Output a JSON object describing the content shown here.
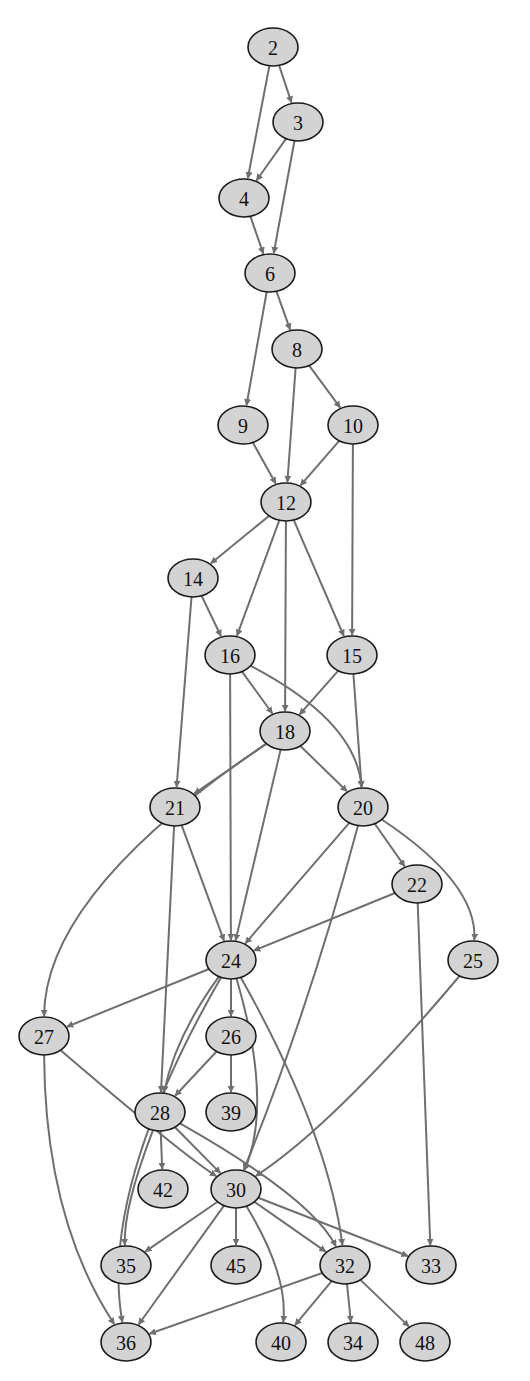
{
  "graph": {
    "type": "directed-acyclic-graph",
    "colors": {
      "node_fill": "#d3d3d3",
      "node_stroke": "#1a1a1a",
      "edge": "#6f6f6f",
      "background": "#ffffff"
    },
    "nodes": [
      {
        "id": "2",
        "label": "2",
        "x": 273,
        "y": 47
      },
      {
        "id": "3",
        "label": "3",
        "x": 298,
        "y": 122
      },
      {
        "id": "4",
        "label": "4",
        "x": 244,
        "y": 198
      },
      {
        "id": "6",
        "label": "6",
        "x": 270,
        "y": 273
      },
      {
        "id": "8",
        "label": "8",
        "x": 297,
        "y": 349
      },
      {
        "id": "9",
        "label": "9",
        "x": 243,
        "y": 425
      },
      {
        "id": "10",
        "label": "10",
        "x": 353,
        "y": 425
      },
      {
        "id": "12",
        "label": "12",
        "x": 286,
        "y": 502
      },
      {
        "id": "14",
        "label": "14",
        "x": 193,
        "y": 578
      },
      {
        "id": "16",
        "label": "16",
        "x": 230,
        "y": 655
      },
      {
        "id": "15",
        "label": "15",
        "x": 352,
        "y": 655
      },
      {
        "id": "18",
        "label": "18",
        "x": 285,
        "y": 731
      },
      {
        "id": "21",
        "label": "21",
        "x": 175,
        "y": 807
      },
      {
        "id": "20",
        "label": "20",
        "x": 363,
        "y": 807
      },
      {
        "id": "22",
        "label": "22",
        "x": 417,
        "y": 884
      },
      {
        "id": "24",
        "label": "24",
        "x": 231,
        "y": 960
      },
      {
        "id": "25",
        "label": "25",
        "x": 473,
        "y": 960
      },
      {
        "id": "27",
        "label": "27",
        "x": 44,
        "y": 1036
      },
      {
        "id": "26",
        "label": "26",
        "x": 231,
        "y": 1036
      },
      {
        "id": "28",
        "label": "28",
        "x": 160,
        "y": 1112
      },
      {
        "id": "39",
        "label": "39",
        "x": 231,
        "y": 1112
      },
      {
        "id": "42",
        "label": "42",
        "x": 163,
        "y": 1189
      },
      {
        "id": "30",
        "label": "30",
        "x": 236,
        "y": 1189
      },
      {
        "id": "35",
        "label": "35",
        "x": 126,
        "y": 1265
      },
      {
        "id": "45",
        "label": "45",
        "x": 236,
        "y": 1265
      },
      {
        "id": "32",
        "label": "32",
        "x": 345,
        "y": 1265
      },
      {
        "id": "33",
        "label": "33",
        "x": 431,
        "y": 1265
      },
      {
        "id": "36",
        "label": "36",
        "x": 126,
        "y": 1342
      },
      {
        "id": "40",
        "label": "40",
        "x": 281,
        "y": 1342
      },
      {
        "id": "34",
        "label": "34",
        "x": 353,
        "y": 1342
      },
      {
        "id": "48",
        "label": "48",
        "x": 425,
        "y": 1342
      }
    ],
    "edges": [
      {
        "from": "2",
        "to": "3"
      },
      {
        "from": "2",
        "to": "4"
      },
      {
        "from": "3",
        "to": "4"
      },
      {
        "from": "3",
        "to": "6"
      },
      {
        "from": "4",
        "to": "6"
      },
      {
        "from": "6",
        "to": "8"
      },
      {
        "from": "6",
        "to": "9"
      },
      {
        "from": "8",
        "to": "10"
      },
      {
        "from": "8",
        "to": "12"
      },
      {
        "from": "9",
        "to": "12"
      },
      {
        "from": "10",
        "to": "12"
      },
      {
        "from": "10",
        "to": "15"
      },
      {
        "from": "12",
        "to": "14"
      },
      {
        "from": "12",
        "to": "16"
      },
      {
        "from": "12",
        "to": "18"
      },
      {
        "from": "12",
        "to": "15"
      },
      {
        "from": "14",
        "to": "16"
      },
      {
        "from": "14",
        "to": "21"
      },
      {
        "from": "16",
        "to": "18"
      },
      {
        "from": "16",
        "to": "20"
      },
      {
        "from": "16",
        "to": "24"
      },
      {
        "from": "15",
        "to": "18"
      },
      {
        "from": "15",
        "to": "20"
      },
      {
        "from": "18",
        "to": "21"
      },
      {
        "from": "18",
        "to": "20"
      },
      {
        "from": "18",
        "to": "24"
      },
      {
        "from": "18",
        "to": "27"
      },
      {
        "from": "21",
        "to": "24"
      },
      {
        "from": "21",
        "to": "28"
      },
      {
        "from": "20",
        "to": "24"
      },
      {
        "from": "20",
        "to": "22"
      },
      {
        "from": "20",
        "to": "25"
      },
      {
        "from": "20",
        "to": "30"
      },
      {
        "from": "22",
        "to": "24"
      },
      {
        "from": "22",
        "to": "33"
      },
      {
        "from": "25",
        "to": "30"
      },
      {
        "from": "24",
        "to": "27"
      },
      {
        "from": "24",
        "to": "26"
      },
      {
        "from": "24",
        "to": "28"
      },
      {
        "from": "24",
        "to": "36"
      },
      {
        "from": "24",
        "to": "30"
      },
      {
        "from": "24",
        "to": "32"
      },
      {
        "from": "26",
        "to": "28"
      },
      {
        "from": "26",
        "to": "39"
      },
      {
        "from": "27",
        "to": "30"
      },
      {
        "from": "27",
        "to": "36"
      },
      {
        "from": "28",
        "to": "42"
      },
      {
        "from": "28",
        "to": "30"
      },
      {
        "from": "28",
        "to": "35"
      },
      {
        "from": "28",
        "to": "32"
      },
      {
        "from": "30",
        "to": "35"
      },
      {
        "from": "30",
        "to": "45"
      },
      {
        "from": "30",
        "to": "36"
      },
      {
        "from": "30",
        "to": "40"
      },
      {
        "from": "30",
        "to": "32"
      },
      {
        "from": "30",
        "to": "33"
      },
      {
        "from": "32",
        "to": "36"
      },
      {
        "from": "32",
        "to": "40"
      },
      {
        "from": "32",
        "to": "34"
      },
      {
        "from": "32",
        "to": "48"
      }
    ]
  }
}
